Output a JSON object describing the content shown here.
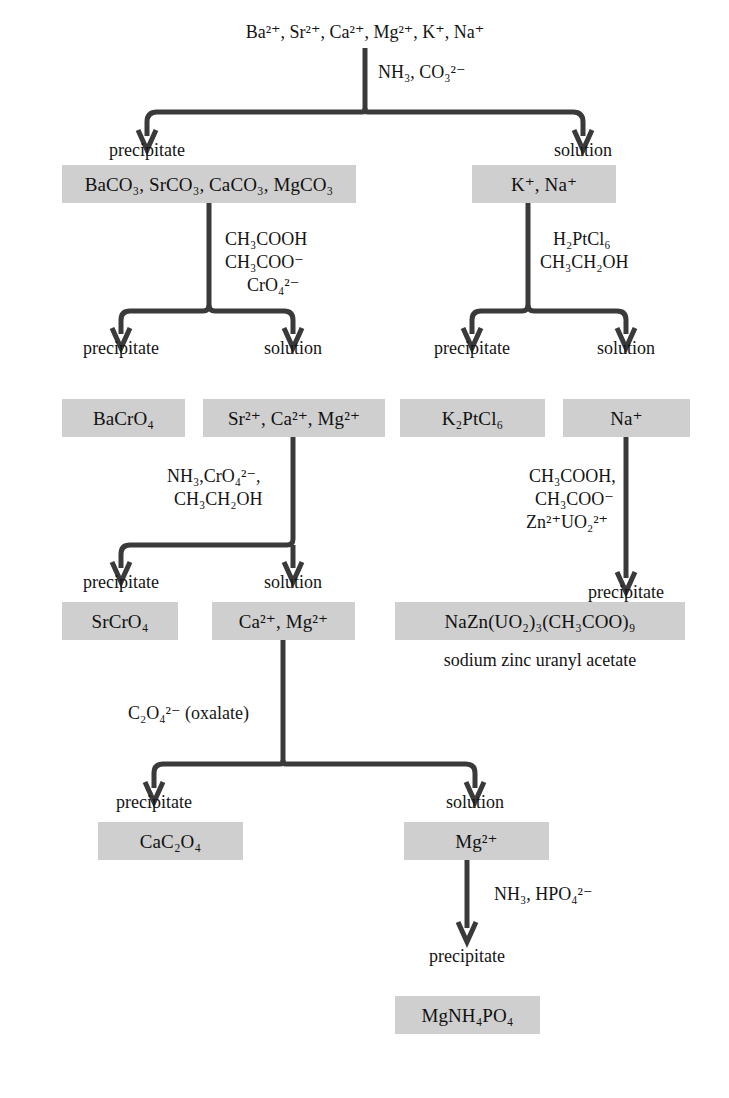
{
  "diagram": {
    "box_color": "#cfcfcf",
    "line_color": "#3a3a3a"
  },
  "nodes": {
    "start_ions": "Ba²⁺, Sr²⁺, Ca²⁺, Mg²⁺, K⁺, Na⁺",
    "carbonates_box": "BaCO₃, SrCO₃, CaCO₃, MgCO₃",
    "alkali_box": "K⁺, Na⁺",
    "bacro4_box": "BaCrO₄",
    "sr_ca_mg_box": "Sr²⁺, Ca²⁺, Mg²⁺",
    "k2ptcl6_box": "K₂PtCl₆",
    "na_box": "Na⁺",
    "srcro4_box": "SrCrO₄",
    "ca_mg_box": "Ca²⁺, Mg²⁺",
    "uranyl_box": "NaZn(UO₂)₃(CH₃COO)₉",
    "uranyl_caption": "sodium zinc uranyl acetate",
    "cac2o4_box": "CaC₂O₄",
    "mg_box": "Mg²⁺",
    "mgnh4po4_box": "MgNH₄PO₄"
  },
  "reagents": {
    "step1": [
      "NH₃, CO₃²⁻"
    ],
    "step2_left": [
      "CH₃COOH",
      "CH₃COO⁻",
      "CrO₄²⁻"
    ],
    "step2_right": [
      "H₂PtCl₆",
      "CH₃CH₂OH"
    ],
    "step3_left": [
      "NH₃,CrO₄²⁻,",
      "CH₃CH₂OH"
    ],
    "step3_right": [
      "CH₃COOH,",
      "CH₃COO⁻",
      "Zn²⁺UO₂²⁺"
    ],
    "step4": [
      "C₂O₄²⁻ (oxalate)"
    ],
    "step5": [
      "NH₃, HPO₄²⁻"
    ]
  },
  "branch_labels": {
    "precipitate": "precipitate",
    "solution": "solution"
  }
}
